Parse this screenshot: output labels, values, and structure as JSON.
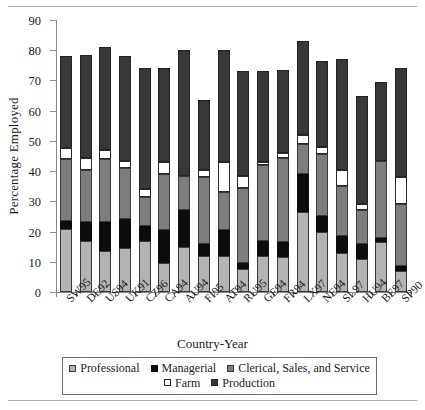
{
  "chart_data": {
    "type": "bar",
    "stacked": true,
    "title": "",
    "xlabel": "Country-Year",
    "ylabel": "Percentage Employed",
    "ylim": [
      0,
      90
    ],
    "ytick_step": 10,
    "yticks": [
      0,
      10,
      20,
      30,
      40,
      50,
      60,
      70,
      80,
      90
    ],
    "grid": false,
    "legend_position": "bottom",
    "categories": [
      "SW95",
      "DE92",
      "US94",
      "UK91",
      "CZ96",
      "CA94",
      "AU94",
      "FI95",
      "AT94",
      "RU95",
      "GE94",
      "FR94",
      "LX97",
      "NE94",
      "SL97",
      "HU94",
      "BE97",
      "SP90"
    ],
    "series": [
      {
        "name": "Professional",
        "color": "#b3b3b3",
        "values": [
          21.0,
          17.0,
          13.5,
          14.5,
          17.0,
          9.5,
          15.0,
          12.0,
          12.0,
          7.5,
          12.0,
          11.5,
          26.5,
          20.0,
          13.0,
          11.0,
          16.5,
          7.0
        ]
      },
      {
        "name": "Managerial",
        "color": "#0d0d0d",
        "values": [
          2.5,
          6.0,
          9.5,
          9.5,
          5.0,
          11.0,
          12.0,
          4.0,
          8.5,
          2.0,
          5.0,
          5.0,
          12.5,
          5.0,
          5.5,
          5.0,
          1.5,
          1.5
        ]
      },
      {
        "name": "Clerical, Sales, and Service",
        "color": "#7d7d7d",
        "values": [
          20.5,
          17.5,
          21.0,
          17.0,
          9.5,
          18.5,
          11.5,
          22.0,
          12.5,
          25.0,
          25.0,
          28.0,
          10.0,
          20.5,
          16.5,
          11.0,
          25.5,
          20.5
        ]
      },
      {
        "name": "Farm",
        "color": "#ffffff",
        "values": [
          3.5,
          4.0,
          3.0,
          2.5,
          2.5,
          4.0,
          0.0,
          2.5,
          10.0,
          4.0,
          1.0,
          1.5,
          3.0,
          2.5,
          5.5,
          2.0,
          0.0,
          9.0
        ]
      },
      {
        "name": "Production",
        "color": "#383838",
        "values": [
          30.5,
          34.0,
          34.0,
          34.5,
          40.0,
          31.0,
          41.5,
          23.0,
          37.0,
          34.5,
          30.0,
          27.5,
          31.0,
          28.5,
          36.5,
          36.0,
          26.0,
          36.0
        ]
      }
    ],
    "totals": [
      78.0,
      78.5,
      81.0,
      78.0,
      74.0,
      74.0,
      80.0,
      63.5,
      80.0,
      73.0,
      73.0,
      73.5,
      83.0,
      76.5,
      77.0,
      65.0,
      69.5,
      74.0
    ],
    "legend": [
      {
        "label": "Professional",
        "color": "#b3b3b3"
      },
      {
        "label": "Managerial",
        "color": "#0d0d0d"
      },
      {
        "label": "Clerical, Sales, and Service",
        "color": "#7d7d7d"
      },
      {
        "label": "Farm",
        "color": "#ffffff"
      },
      {
        "label": "Production",
        "color": "#383838"
      }
    ]
  }
}
